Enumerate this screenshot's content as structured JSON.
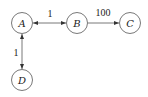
{
  "diagram": {
    "type": "directed-graph",
    "colors": {
      "stroke": "#555555",
      "text": "#222222",
      "background": "#ffffff"
    },
    "nodes": [
      {
        "id": "A",
        "label": "A",
        "cx": 22,
        "cy": 23
      },
      {
        "id": "B",
        "label": "B",
        "cx": 77,
        "cy": 23
      },
      {
        "id": "C",
        "label": "C",
        "cx": 130,
        "cy": 23
      },
      {
        "id": "D",
        "label": "D",
        "cx": 22,
        "cy": 80
      }
    ],
    "edges": [
      {
        "from": "A",
        "to": "B",
        "bidirectional": true,
        "weight": "1"
      },
      {
        "from": "B",
        "to": "C",
        "bidirectional": false,
        "weight": "100"
      },
      {
        "from": "A",
        "to": "D",
        "bidirectional": true,
        "weight": "1"
      }
    ]
  }
}
